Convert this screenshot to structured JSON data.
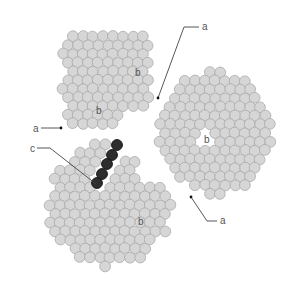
{
  "diagram": {
    "colors": {
      "fiber_fill": "#d6d6d6",
      "fiber_stroke": "#a9a9a9",
      "highlight_fill": "#2e2e2e",
      "highlight_stroke": "#151515",
      "line": "#444444",
      "label": "#555555"
    },
    "fiber_radius": 5.4,
    "fiber_spacing": 10,
    "clusters": [
      {
        "name": "upper-left-bundle",
        "cx": 108,
        "cy": 80,
        "rx": 46,
        "ry": 50,
        "cut": "upper-left"
      },
      {
        "name": "right-bundle",
        "cx": 215,
        "cy": 133,
        "rx": 57,
        "ry": 62,
        "cut": "right"
      },
      {
        "name": "lower-left-bundle",
        "cx": 110,
        "cy": 205,
        "rx": 62,
        "ry": 62,
        "cut": "lower-left"
      }
    ],
    "highlighted_fibers": [
      {
        "x": 117,
        "y": 145
      },
      {
        "x": 112,
        "y": 155
      },
      {
        "x": 107,
        "y": 164
      },
      {
        "x": 102,
        "y": 174
      },
      {
        "x": 97,
        "y": 183
      }
    ],
    "labels": [
      {
        "id": "label-a-top",
        "text": "a",
        "x": 202,
        "y": 30
      },
      {
        "id": "label-a-left",
        "text": "a",
        "x": 33,
        "y": 132
      },
      {
        "id": "label-c",
        "text": "c",
        "x": 30,
        "y": 152
      },
      {
        "id": "label-a-bottom-right",
        "text": "a",
        "x": 220,
        "y": 224
      },
      {
        "id": "label-b-1",
        "text": "b",
        "x": 135,
        "y": 76
      },
      {
        "id": "label-b-2",
        "text": "b",
        "x": 96,
        "y": 114
      },
      {
        "id": "label-b-3",
        "text": "b",
        "x": 204,
        "y": 143
      },
      {
        "id": "label-b-4",
        "text": "b",
        "x": 138,
        "y": 225
      }
    ],
    "leaders": [
      {
        "id": "leader-a-top",
        "points": [
          [
            199,
            27
          ],
          [
            184,
            27
          ],
          [
            158,
            98
          ]
        ],
        "dot": [
          158,
          98
        ]
      },
      {
        "id": "leader-a-left",
        "points": [
          [
            41,
            128
          ],
          [
            60,
            128
          ]
        ],
        "dot": [
          61,
          128
        ]
      },
      {
        "id": "leader-c",
        "points": [
          [
            37,
            148
          ],
          [
            50,
            148
          ],
          [
            96,
            184
          ]
        ],
        "dot": null
      },
      {
        "id": "leader-a-bottom-right",
        "points": [
          [
            217,
            221
          ],
          [
            207,
            221
          ],
          [
            191,
            197
          ]
        ],
        "dot": [
          191,
          197
        ]
      }
    ]
  }
}
